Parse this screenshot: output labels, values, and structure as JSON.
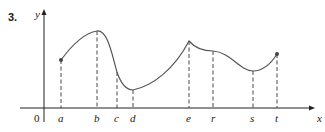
{
  "problem_number": "3.",
  "axes": {
    "x_label": "x",
    "y_label": "y",
    "origin_label": "0"
  },
  "points": [
    {
      "label": "a",
      "x": 61,
      "y": 60,
      "marker": true
    },
    {
      "label": "b",
      "x": 97,
      "y": 31,
      "marker": false
    },
    {
      "label": "c",
      "x": 117,
      "y": 72,
      "marker": false
    },
    {
      "label": "d",
      "x": 133,
      "y": 90,
      "marker": false
    },
    {
      "label": "e",
      "x": 189,
      "y": 41,
      "marker": false
    },
    {
      "label": "r",
      "x": 213,
      "y": 51,
      "marker": false
    },
    {
      "label": "s",
      "x": 253,
      "y": 71,
      "marker": false
    },
    {
      "label": "t",
      "x": 277,
      "y": 54,
      "marker": true
    }
  ],
  "colors": {
    "curve": "#555555",
    "axis": "#222222",
    "dashed": "#333333"
  }
}
